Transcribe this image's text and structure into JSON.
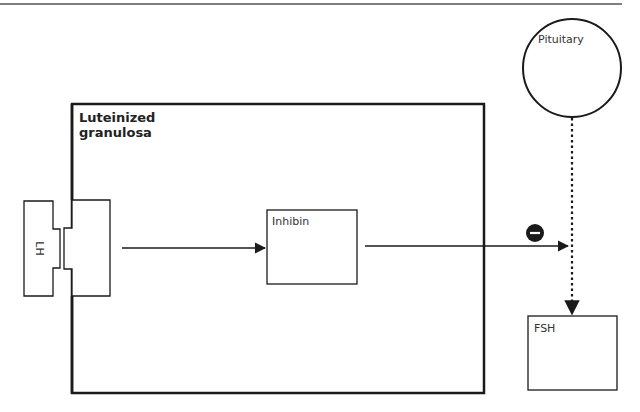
{
  "diagram": {
    "cell": {
      "label_line1": "Luteinized",
      "label_line2": "granulosa"
    },
    "ligand": {
      "label": "LH"
    },
    "product": {
      "label": "Inhibin"
    },
    "gland": {
      "label": "Pituitary"
    },
    "target": {
      "label": "FSH"
    },
    "inhibition_symbol": "−",
    "colors": {
      "stroke": "#1a1a1a",
      "rule": "#555555"
    }
  }
}
